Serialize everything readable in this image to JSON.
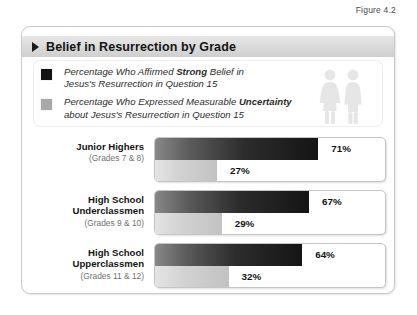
{
  "figure": {
    "label": "Figure 4.2"
  },
  "card": {
    "title": "Belief in Resurrection by Grade",
    "title_arrow_icon": "triangle-right-icon"
  },
  "legend": {
    "items": [
      {
        "swatch_color": "#131313",
        "swatch_name": "legend-swatch-dark",
        "line1_prefix": "Percentage Who Affirmed ",
        "line1_emphasis": "Strong",
        "line1_suffix": " Belief in",
        "line2": "Jesus's Resurrection in Question 15"
      },
      {
        "swatch_color": "#a9a9a9",
        "swatch_name": "legend-swatch-gray",
        "line1_prefix": "Percentage Who Expressed Measurable ",
        "line1_emphasis": "Uncertainty",
        "line1_suffix": "",
        "line2": "about Jesus's Resurrection in Question 15"
      }
    ],
    "people_icon": "two-people-icon"
  },
  "chart_data": {
    "type": "bar",
    "title": "Belief in Resurrection by Grade",
    "xlabel": "",
    "ylabel": "",
    "xlim": [
      0,
      100
    ],
    "grid": false,
    "legend_position": "top",
    "orientation": "horizontal",
    "value_unit": "%",
    "categories": [
      "Junior Highers",
      "High School Underclassmen",
      "High School Upperclassmen"
    ],
    "category_sublabels": [
      "(Grades 7 & 8)",
      "(Grades 9 & 10)",
      "(Grades 11 & 12)"
    ],
    "series": [
      {
        "name": "Percentage Who Affirmed Strong Belief in Jesus's Resurrection in Question 15",
        "color": "#131313",
        "values": [
          71,
          67,
          64
        ],
        "labels": [
          "71%",
          "67%",
          "64%"
        ]
      },
      {
        "name": "Percentage Who Expressed Measurable Uncertainty about Jesus's Resurrection in Question 15",
        "color": "#a9a9a9",
        "values": [
          27,
          29,
          32
        ],
        "labels": [
          "27%",
          "29%",
          "32%"
        ]
      }
    ]
  },
  "groups": [
    {
      "name": "Junior Highers",
      "grades": "(Grades 7 & 8)",
      "strong_label": "71%",
      "strong_pct": 71,
      "uncertain_label": "27%",
      "uncertain_pct": 27
    },
    {
      "name": "High School Underclassmen",
      "grades": "(Grades 9 & 10)",
      "strong_label": "67%",
      "strong_pct": 67,
      "uncertain_label": "29%",
      "uncertain_pct": 29
    },
    {
      "name": "High School Upperclassmen",
      "grades": "(Grades 11 & 12)",
      "strong_label": "64%",
      "strong_pct": 64,
      "uncertain_label": "32%",
      "uncertain_pct": 32
    }
  ]
}
